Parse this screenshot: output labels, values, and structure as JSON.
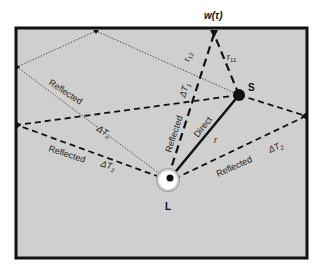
{
  "diagram": {
    "title_label": "w(τ)",
    "nodes": {
      "source": "S",
      "listener": "L"
    },
    "labels": {
      "r11": "r",
      "r11_sub": "11",
      "r12": "r",
      "r12_sub": "12",
      "direct": "Direct",
      "r": "r",
      "reflected_top_left": "Reflected",
      "reflected_left": "Reflected",
      "reflected_right": "Reflected",
      "reflected_center": "Reflected",
      "delta_t1": "ΔT",
      "delta_t1_sub": "1",
      "delta_t2": "ΔT",
      "delta_t2_sub": "2",
      "delta_t3": "ΔT",
      "delta_t3_sub": "3",
      "delta_tn": "ΔT",
      "delta_tn_sub": "n"
    },
    "colors": {
      "room_fill": "#cfcfcf",
      "frame": "#111111",
      "listener_halo": "#ffffff"
    }
  }
}
